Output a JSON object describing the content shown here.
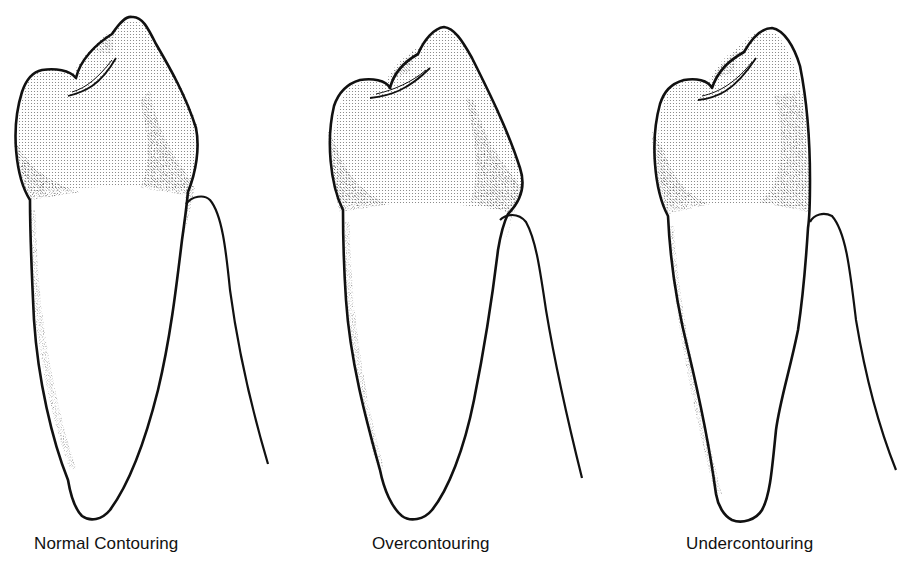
{
  "figure": {
    "panels": [
      {
        "id": "normal",
        "caption": "Normal Contouring"
      },
      {
        "id": "over",
        "caption": "Overcontouring"
      },
      {
        "id": "under",
        "caption": "Undercontouring"
      }
    ],
    "colors": {
      "line": "#111111",
      "crown_fill": "#e2e2e2",
      "stipple": "#1a1a1a",
      "background": "#ffffff"
    }
  }
}
